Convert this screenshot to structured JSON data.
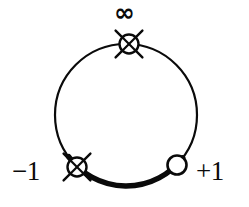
{
  "figure": {
    "kind": "math-diagram",
    "background_color": "#ffffff",
    "stroke_color": "#0a0a0a"
  },
  "circle": {
    "center_x": 126,
    "center_y": 115,
    "radius": 71,
    "stroke_width": 2.2
  },
  "highlight_arc": {
    "description": "thickened arc along the bottom of the circle between the -1 point and the +1 point",
    "start_angle_deg": 216,
    "end_angle_deg": 323,
    "stroke_width": 5.4
  },
  "markers": [
    {
      "id": "infinity",
      "type": "crossed-circle",
      "center_x": 129,
      "center_y": 44,
      "radius": 9.5,
      "cross_arm_length": 19,
      "label": "∞",
      "label_position": "above"
    },
    {
      "id": "minus-one",
      "type": "crossed-circle",
      "center_x": 77,
      "center_y": 167,
      "radius": 9.5,
      "cross_arm_length": 19,
      "label": "−1",
      "label_position": "left"
    },
    {
      "id": "plus-one",
      "type": "open-circle",
      "center_x": 177,
      "center_y": 165,
      "radius": 9.5,
      "label": "+1",
      "label_position": "right"
    }
  ],
  "labels": {
    "infinity": "∞",
    "minus_one": "−1",
    "plus_one": "+1"
  }
}
